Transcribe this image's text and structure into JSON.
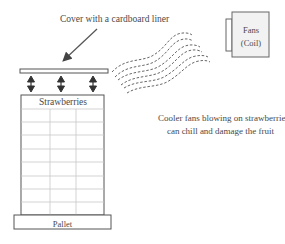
{
  "diagram": {
    "cover_label": "Cover with a cardboard liner",
    "stack_label": "Strawberries",
    "pallet_label": "Pallet",
    "fans_label_line1": "Fans",
    "fans_label_line2": "(Coil)",
    "note_line1": "Cooler fans blowing on strawberries",
    "note_line2": "can chill and damage the fruit"
  },
  "colors": {
    "stroke": "#555555",
    "fan_fill": "#f2f2f2",
    "grid": "#c8c8c8",
    "text": "#4a4a4a"
  }
}
